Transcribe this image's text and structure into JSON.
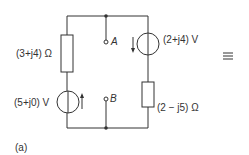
{
  "circuit": {
    "left_impedance": "(3+j4) Ω",
    "left_source": "(5+j0) V",
    "right_source": "(2+j4) V",
    "right_impedance": "(2 − j5) Ω",
    "terminal_a": "A",
    "terminal_b": "B",
    "equiv_symbol": "≡",
    "caption": "(a)"
  },
  "colors": {
    "line": "#333333",
    "background": "#ffffff"
  }
}
